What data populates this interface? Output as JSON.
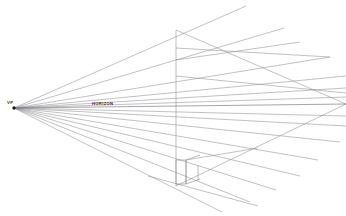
{
  "figure": {
    "background_color": "#ffffff",
    "line_color": "#8d8d93",
    "accent_color": "#1a1a1a",
    "width": 346,
    "height": 216
  },
  "labels": {
    "vanishing_point": "VP",
    "horizon": "HORIZON"
  },
  "chart_data": {
    "type": "line",
    "vanishing_point": {
      "x": 14,
      "y": 108
    },
    "horizon": {
      "x1": 14,
      "y1": 108,
      "x2": 346,
      "y2": 104
    },
    "label_positions": {
      "vp": {
        "x": 7,
        "y": 104
      },
      "horizon": {
        "x": 92,
        "y": 105
      }
    },
    "rays_up": [
      {
        "x1": 14,
        "y1": 108,
        "x2": 246,
        "y2": 6
      },
      {
        "x1": 14,
        "y1": 108,
        "x2": 284,
        "y2": 28
      },
      {
        "x1": 14,
        "y1": 108,
        "x2": 330,
        "y2": 57
      },
      {
        "x1": 14,
        "y1": 108,
        "x2": 346,
        "y2": 76
      },
      {
        "x1": 14,
        "y1": 108,
        "x2": 346,
        "y2": 88
      },
      {
        "x1": 14,
        "y1": 108,
        "x2": 346,
        "y2": 97
      }
    ],
    "rays_down": [
      {
        "x1": 14,
        "y1": 108,
        "x2": 346,
        "y2": 116
      },
      {
        "x1": 14,
        "y1": 108,
        "x2": 346,
        "y2": 126
      },
      {
        "x1": 14,
        "y1": 108,
        "x2": 340,
        "y2": 142
      },
      {
        "x1": 14,
        "y1": 108,
        "x2": 318,
        "y2": 160
      },
      {
        "x1": 14,
        "y1": 108,
        "x2": 300,
        "y2": 176
      },
      {
        "x1": 14,
        "y1": 108,
        "x2": 276,
        "y2": 190
      },
      {
        "x1": 14,
        "y1": 108,
        "x2": 250,
        "y2": 202
      },
      {
        "x1": 14,
        "y1": 108,
        "x2": 222,
        "y2": 212
      }
    ],
    "vertical_lines": [
      {
        "x1": 176,
        "y1": 30,
        "x2": 176,
        "y2": 186
      },
      {
        "x1": 186,
        "y1": 160,
        "x2": 186,
        "y2": 184
      },
      {
        "x1": 198,
        "y1": 165,
        "x2": 198,
        "y2": 180
      }
    ],
    "cross_edges": [
      {
        "x1": 176,
        "y1": 30,
        "x2": 346,
        "y2": 104
      },
      {
        "x1": 176,
        "y1": 48,
        "x2": 330,
        "y2": 57
      },
      {
        "x1": 176,
        "y1": 60,
        "x2": 300,
        "y2": 42
      },
      {
        "x1": 176,
        "y1": 76,
        "x2": 346,
        "y2": 93
      },
      {
        "x1": 176,
        "y1": 186,
        "x2": 346,
        "y2": 104
      },
      {
        "x1": 186,
        "y1": 160,
        "x2": 258,
        "y2": 148
      },
      {
        "x1": 148,
        "y1": 176,
        "x2": 258,
        "y2": 206
      }
    ],
    "box": {
      "front_top_left": {
        "x": 176,
        "y": 160
      },
      "front_bottom_left": {
        "x": 176,
        "y": 184
      },
      "front_top_right": {
        "x": 186,
        "y": 160
      },
      "front_bottom_right": {
        "x": 186,
        "y": 184
      }
    },
    "xlabel": "",
    "ylabel": "",
    "grid": false,
    "legend": "none"
  }
}
